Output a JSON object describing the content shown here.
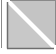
{
  "icon": {
    "name": "diagonal-split-icon",
    "fill_color": "#c8c8c8",
    "border_color": "#6e6e6e",
    "divider_color": "#ffffff"
  }
}
